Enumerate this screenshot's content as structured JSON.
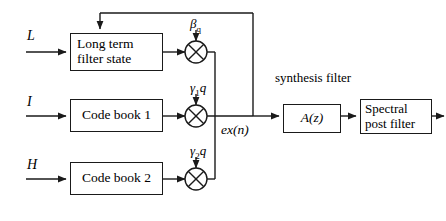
{
  "diagram": {
    "inputs": [
      {
        "name": "long-term-input",
        "label": "L"
      },
      {
        "name": "codebook1-input",
        "label": "I"
      },
      {
        "name": "codebook2-input",
        "label": "H"
      }
    ],
    "blocks": [
      {
        "name": "long-term-filter-state",
        "line1": "Long term",
        "line2": "filter state"
      },
      {
        "name": "code-book-1",
        "line1": "Code book 1"
      },
      {
        "name": "code-book-2",
        "line1": "Code book 2"
      },
      {
        "name": "synthesis-filter",
        "line1": "A(z)"
      },
      {
        "name": "spectral-post-filter",
        "line1": "Spectral",
        "line2": "post filter"
      }
    ],
    "gains": [
      {
        "name": "beta-q-gain",
        "symbol": "β",
        "subscript": "q"
      },
      {
        "name": "gamma-1-q-gain",
        "symbol": "γ",
        "subscript": "1",
        "factor": "q"
      },
      {
        "name": "gamma-2-q-gain",
        "symbol": "γ",
        "subscript": "2",
        "factor": "q"
      }
    ],
    "signals": {
      "excitation": "ex(n)"
    },
    "captions": {
      "synthesis_filter_line1": "synthesis",
      "synthesis_filter_line2": "filter"
    },
    "colors": {
      "line": "#1a1a1a",
      "background": "#ffffff",
      "text": "#000000"
    }
  }
}
